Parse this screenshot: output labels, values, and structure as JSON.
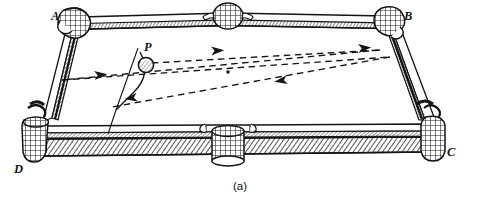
{
  "figure": {
    "caption": "(a)",
    "colors": {
      "ink": "#141414",
      "paper": "#ffffff",
      "rail_fill": "#ffffff",
      "cushion_hatch": "#2b2b2b",
      "rail_shadow": "#4a4a4a"
    }
  },
  "labels": {
    "corner_a": "A",
    "corner_b": "B",
    "corner_c": "C",
    "corner_d": "D",
    "ball": "P"
  },
  "table": {
    "corners": {
      "A": {
        "x": 70,
        "y": 22
      },
      "B": {
        "x": 398,
        "y": 22
      },
      "C": {
        "x": 437,
        "y": 132
      },
      "D": {
        "x": 35,
        "y": 132
      }
    },
    "pockets": [
      {
        "name": "pocket-corner-a",
        "x": 72,
        "y": 22,
        "kind": "corner"
      },
      {
        "name": "pocket-side-top",
        "x": 228,
        "y": 16,
        "kind": "side"
      },
      {
        "name": "pocket-corner-b",
        "x": 392,
        "y": 21,
        "kind": "corner"
      },
      {
        "name": "pocket-corner-c",
        "x": 438,
        "y": 130,
        "kind": "corner"
      },
      {
        "name": "pocket-side-bottom",
        "x": 228,
        "y": 140,
        "kind": "side"
      },
      {
        "name": "pocket-corner-d",
        "x": 36,
        "y": 128,
        "kind": "corner"
      }
    ],
    "center_spot": {
      "x": 228,
      "y": 72
    }
  },
  "ball": {
    "name": "ball-p",
    "x": 146,
    "y": 65,
    "radius": 7.5
  },
  "path": {
    "description": "dashed reflection path of ball P off three cushions",
    "vertices": [
      {
        "x": 146,
        "y": 65,
        "node": "start-at-ball-p"
      },
      {
        "x": 380,
        "y": 50,
        "node": "bounce-right-rail-upper"
      },
      {
        "x": 62,
        "y": 80,
        "node": "bounce-left-rail"
      },
      {
        "x": 390,
        "y": 57,
        "node": "bounce-right-rail-lower"
      },
      {
        "x": 112,
        "y": 107,
        "node": "end-lower-left"
      }
    ],
    "arrows": [
      {
        "x": 218,
        "y": 51,
        "angle": -4
      },
      {
        "x": 103,
        "y": 75,
        "angle": -8
      },
      {
        "x": 367,
        "y": 48,
        "angle": -4
      },
      {
        "x": 279,
        "y": 88,
        "angle": 171
      },
      {
        "x": 130,
        "y": 105,
        "angle": 171
      }
    ]
  },
  "angle_marker": {
    "name": "angle-arc-at-ball",
    "apex": {
      "x": 116,
      "y": 110
    },
    "description": "solid arc and two rays marking the shot angle at the ball"
  }
}
